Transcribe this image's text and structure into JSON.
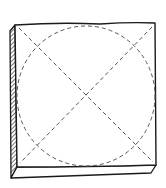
{
  "figure": {
    "colors": {
      "ink": "#1a1a1a",
      "dash": "#555555",
      "background": "#ffffff"
    },
    "elements": [
      {
        "name": "slab-top-face",
        "shape": "square"
      },
      {
        "name": "slab-left-edge",
        "shape": "hatched-side"
      },
      {
        "name": "slab-bottom-edge",
        "shape": "thickness"
      },
      {
        "name": "diagonal-1",
        "shape": "dashed-line"
      },
      {
        "name": "diagonal-2",
        "shape": "dashed-line"
      },
      {
        "name": "inscribed-circle",
        "shape": "dashed-circle"
      }
    ]
  }
}
